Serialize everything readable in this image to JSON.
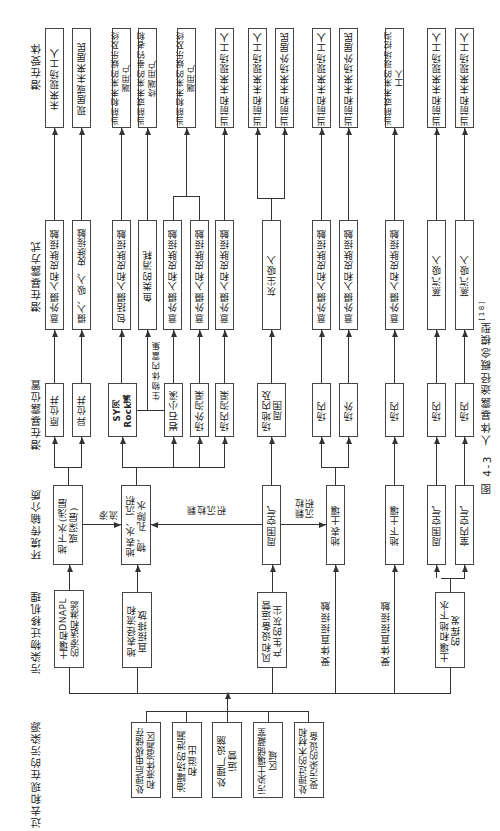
{
  "caption": {
    "label": "图 4-3",
    "title": "人体暴露途径概念模型",
    "ref": "[18]"
  },
  "headers": {
    "sources": "过去和现在的污染源",
    "mechanisms": "污染物迁移机理",
    "media": "环境传输介质",
    "locations": "潜在暴露位置",
    "routes": "潜在暴露方式",
    "receptors": "潜在受体"
  },
  "sources": [
    "处理后电极储存\n和液体溶漏区",
    "油罐场的泄漏\n和溢出",
    "处理厂设施\n运营",
    "污染土壤储藏室\n区域",
    "处理过的木材和\n受污染的设备"
  ],
  "mechanisms": [
    "土壤和DNAPL\n的渗透和淋滤",
    "地表径流和\n直接排放",
    "风和设备运营\n产生的灰尘",
    "受体直接接触",
    "受体直接接触",
    "土壤和地下水\n的挥发"
  ],
  "media": [
    "地下水(浅层\n或深层)",
    "地表水、沉积\n物、孔隙水",
    "周围空气",
    "地表土壤",
    "地下土壤",
    "周围空气",
    "室内空气"
  ],
  "flow_labels": {
    "seepage": "渗\n流",
    "particle_deposition_1": "颗\n粒\n沉\n积",
    "particle_deposition_2": "颗粒\n沉积",
    "bioaccumulation": "生物体内富集"
  },
  "locations": [
    "原位井",
    "异位井",
    "SY河\nRock溪",
    "岩石小溪",
    "场外沟渠",
    "场内沟渠",
    "场地内及\n周围",
    "场内",
    "场外",
    "场内",
    "场内",
    "场内"
  ],
  "routes": [
    "意外摄入和皮肤接触",
    "摄入、吸入、皮肤接触",
    "包括摄入和皮肤接触",
    "鱼类的消耗",
    "意外摄入和皮肤接触",
    "意外摄入和皮肤接触",
    "意外摄入和皮肤接触",
    "灰尘吸入",
    "意外摄入和皮肤接触",
    "意外摄入和皮肤接触",
    "意外摄入和皮肤接触",
    "蒸汽吸入",
    "蒸汽吸入"
  ],
  "receptors": [
    "未来现场工人",
    "现居或未来居民",
    "当前和未来的娱乐及终端用户",
    "当前或未来的垂钓者和终端用户",
    "当前和未来的娱乐及终端用户",
    "当前和未来现场工人",
    "当前和未来现场工人",
    "当前和未来场外居民",
    "当前和未来现场工人",
    "当前和未来场外居民",
    "当前或未来的现场挖沟工人",
    "当前和未来现场工人",
    "当前和未来现场工人"
  ]
}
